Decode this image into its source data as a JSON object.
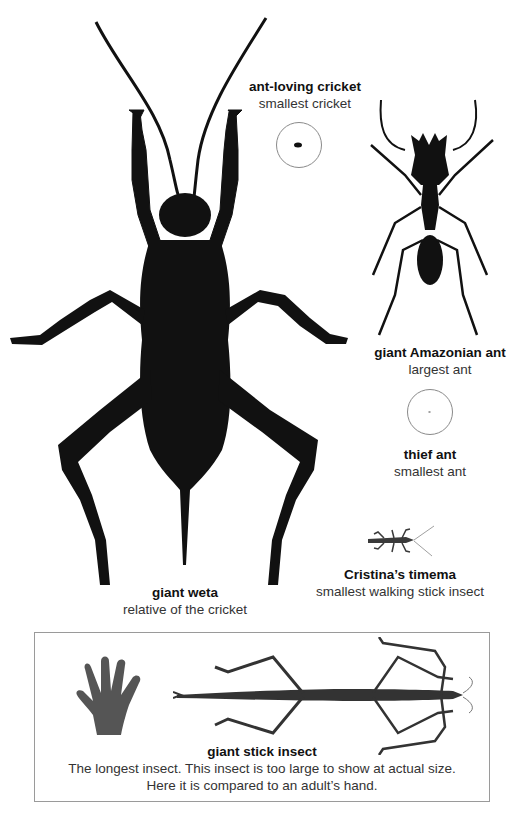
{
  "colors": {
    "silhouette": "#111111",
    "hand": "#555555",
    "stick_insect": "#333333",
    "circle_outline": "#8a8a8a",
    "box_border": "#9a9a9a"
  },
  "insects": {
    "ant_loving_cricket": {
      "name": "ant-loving cricket",
      "desc": "smallest cricket"
    },
    "giant_amazonian_ant": {
      "name": "giant Amazonian ant",
      "desc": "largest ant"
    },
    "thief_ant": {
      "name": "thief ant",
      "desc": "smallest ant"
    },
    "cristinas_timema": {
      "name": "Cristina’s timema",
      "desc": "smallest walking stick insect"
    },
    "giant_weta": {
      "name": "giant weta",
      "desc": "relative of the cricket"
    }
  },
  "comparison_box": {
    "name": "giant stick insect",
    "desc": "The longest insect. This insect is too large to show at actual size. Here it is compared to an adult’s hand."
  }
}
